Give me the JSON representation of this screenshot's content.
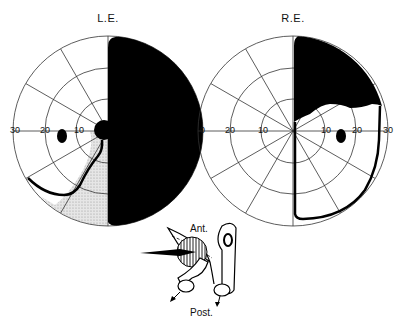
{
  "figure": {
    "left_eye": {
      "title": "L.E.",
      "tick_labels": [
        "30",
        "20",
        "10"
      ],
      "defect": "complete temporal hemianopia (right half) with partial inferior nasal quadrant involvement"
    },
    "right_eye": {
      "title": "R.E.",
      "tick_labels": [
        "0",
        "20",
        "10",
        "10",
        "20",
        "30"
      ],
      "defect": "superior temporal quadrant defect"
    },
    "anatomy_diagram": {
      "top_label": "Ant.",
      "bottom_label": "Post."
    },
    "colors": {
      "ink": "#000000",
      "grid": "#333333",
      "stipple": "#d8d8d8",
      "background": "#ffffff"
    }
  }
}
